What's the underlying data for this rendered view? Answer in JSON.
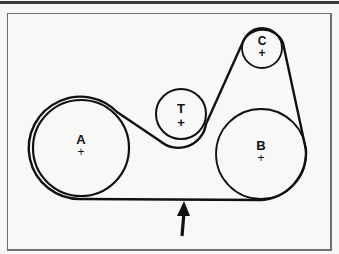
{
  "diagram": {
    "type": "serpentine belt routing",
    "colors": {
      "line": "#111111",
      "frame": "#6e6e6e",
      "background": "#f8f8f6",
      "top_rule": "#3a3a3a"
    },
    "pulleys": [
      {
        "id": "A",
        "label": "A",
        "center_mark": "+",
        "cx": 81,
        "cy": 148,
        "r": 48
      },
      {
        "id": "T",
        "label": "T",
        "center_mark": "+",
        "cx": 181,
        "cy": 114,
        "r": 25
      },
      {
        "id": "C",
        "label": "C",
        "center_mark": "+",
        "cx": 262,
        "cy": 48,
        "r": 20
      },
      {
        "id": "B",
        "label": "B",
        "center_mark": "+",
        "cx": 261,
        "cy": 154,
        "r": 45
      }
    ],
    "arrow": {
      "direction": "up",
      "points_to": "belt bottom span",
      "x": 183
    }
  }
}
